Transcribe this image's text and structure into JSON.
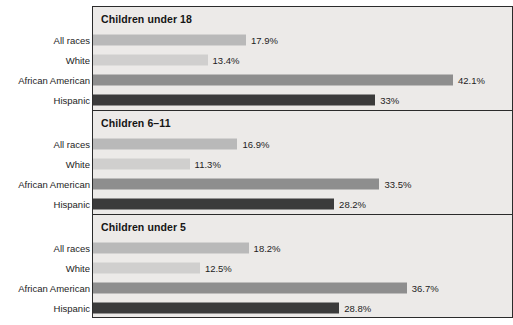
{
  "chart_data": {
    "type": "bar",
    "title": "",
    "subtitle": "",
    "xlabel": "",
    "ylabel": "",
    "orientation": "horizontal",
    "grid": false,
    "legend": "none",
    "value_suffix": "%",
    "xlim": [
      0,
      47
    ],
    "px_per_percent": 8.55,
    "categories": [
      "All races",
      "White",
      "African American",
      "Hispanic"
    ],
    "category_colors": [
      "#b9b9b9",
      "#d0cfce",
      "#8e8e8e",
      "#3b3b3b"
    ],
    "panels": [
      {
        "title": "Children under 18",
        "categories": [
          "All races",
          "White",
          "African American",
          "Hispanic"
        ],
        "values": [
          17.9,
          13.4,
          42.1,
          33
        ],
        "labels": [
          "17.9%",
          "13.4%",
          "42.1%",
          "33%"
        ]
      },
      {
        "title": "Children 6–11",
        "categories": [
          "All races",
          "White",
          "African American",
          "Hispanic"
        ],
        "values": [
          16.9,
          11.3,
          33.5,
          28.2
        ],
        "labels": [
          "16.9%",
          "11.3%",
          "33.5%",
          "28.2%"
        ]
      },
      {
        "title": "Children under 5",
        "categories": [
          "All races",
          "White",
          "African American",
          "Hispanic"
        ],
        "values": [
          18.2,
          12.5,
          36.7,
          28.8
        ],
        "labels": [
          "18.2%",
          "12.5%",
          "36.7%",
          "28.8%"
        ]
      }
    ]
  },
  "colors": {
    "panel_background": "#eceae8",
    "page_background": "#ffffff",
    "border": "#2b2b2b",
    "text": "#1d1d1d",
    "all_races_bar": "#b9b9b9",
    "white_bar": "#d0cfce",
    "african_american_bar": "#8e8e8e",
    "hispanic_bar": "#3b3b3b"
  }
}
